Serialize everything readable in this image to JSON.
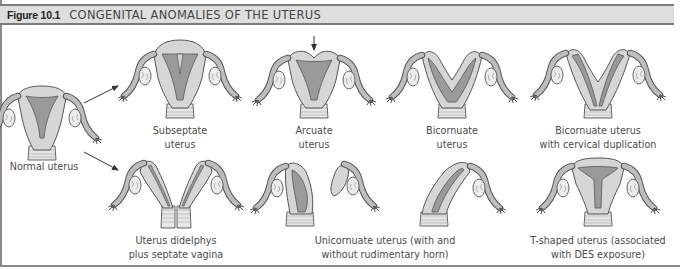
{
  "figure": {
    "label": "Figure 10.1",
    "title": "CONGENITAL ANOMALIES OF THE UTERUS"
  },
  "items": [
    {
      "id": "normal",
      "lines": [
        "Normal uterus"
      ]
    },
    {
      "id": "subseptate",
      "lines": [
        "Subseptate",
        "uterus"
      ]
    },
    {
      "id": "arcuate",
      "lines": [
        "Arcuate",
        "uterus"
      ]
    },
    {
      "id": "bicornuate",
      "lines": [
        "Bicornuate",
        "uterus"
      ]
    },
    {
      "id": "bicornuate-cervical",
      "lines": [
        "Bicornuate uterus",
        "with cervical duplication"
      ]
    },
    {
      "id": "didelphys",
      "lines": [
        "Uterus didelphys",
        "plus septate vagina"
      ]
    },
    {
      "id": "unicornuate",
      "lines": [
        "Unicornuate uterus (with and",
        "without rudimentary horn)"
      ]
    },
    {
      "id": "t-shaped",
      "lines": [
        "T-shaped uterus (associated",
        "with DES exposure)"
      ]
    }
  ],
  "colors": {
    "outline": "#555555",
    "wall": "#d6d6d6",
    "cavity": "#9a9a9a",
    "tube": "#bdbdbd",
    "ovary": "#ececec",
    "header_bg": "#dedede"
  }
}
